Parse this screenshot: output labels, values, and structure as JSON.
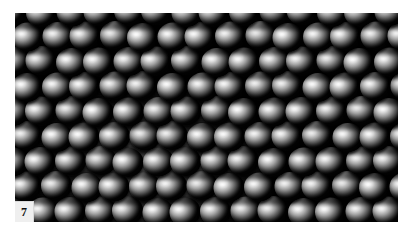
{
  "figure": {
    "number_label": "7",
    "caption": "",
    "kind": "sem-micrograph",
    "plate": {
      "x": 15,
      "y": 13,
      "width": 383,
      "height": 209,
      "background_color": "#000000",
      "page_background_color": "#ffffff"
    },
    "number_chip": {
      "background_color": "#efefef",
      "text_color": "#0d0d0d",
      "x": 15,
      "y": 201,
      "width": 19,
      "height": 21
    },
    "lattice": {
      "packing": "hexagonal",
      "rows": 9,
      "columns_per_row": 15,
      "row_offset_px": 15,
      "particle_width_px": 31,
      "particle_height_px": 29,
      "row_pitch_px": 25
    },
    "illumination": {
      "highlight_side": "upper-left",
      "bright_region": "center-left to bottom-center",
      "dark_region": "right edge and top band",
      "highlight_color": "#ffffff",
      "midtone_color": "#a2a2a2",
      "shadow_color": "#050505"
    }
  }
}
